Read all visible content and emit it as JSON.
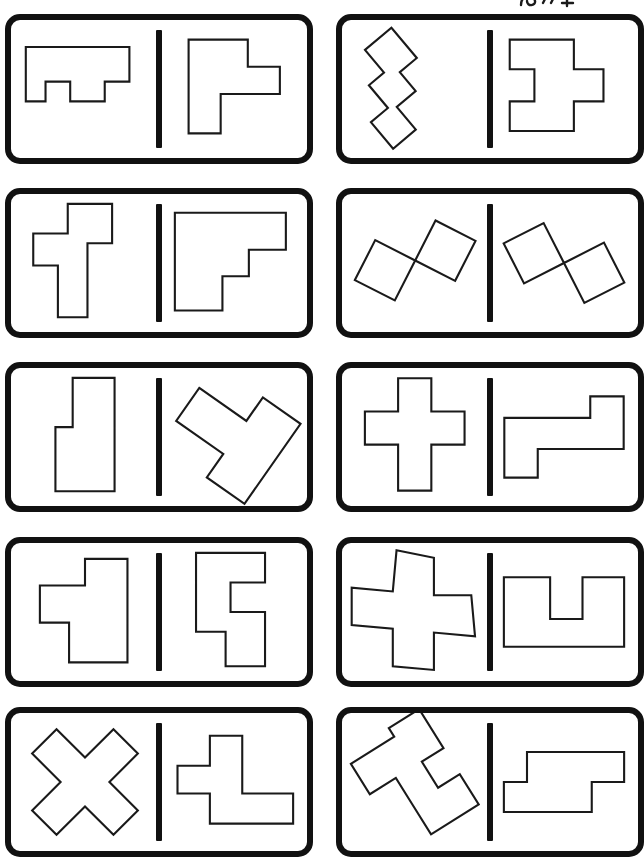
{
  "page": {
    "background_color": "#ffffff",
    "ink_color": "#111111",
    "shape_outline_color": "#1a1a1a",
    "card_count": 10,
    "columns": 2,
    "rows": 5,
    "corner_mark_label": "partial-logo-mark-cropped-at-top-edge"
  },
  "cards": [
    {
      "id": "card-1",
      "row": 1,
      "column": "left",
      "left_shape": {
        "name": "u-shaped-hexomino-notched-bar",
        "rotation_deg": 0,
        "cells": 9,
        "points": "6,8 48,8 48,22 38,22 38,30 24,30 24,22 14,22 14,30 6,30"
      },
      "right_shape": {
        "name": "t-shaped-heptomino-stepped",
        "rotation_deg": 0,
        "cells": 9,
        "points": "12,5 36,5 36,16 49,16 49,27 25,27 25,43 12,43"
      }
    },
    {
      "id": "card-2",
      "row": 1,
      "column": "right",
      "left_shape": {
        "name": "zigzag-zpentomino-rotated",
        "rotation_deg": -40,
        "cells": 8,
        "points": "22,6 36,6 36,22 27,22 27,32 17,32 17,44 5,44 5,30 14,30 14,18 22,18"
      },
      "right_shape": {
        "name": "plus-cross-shaped-nonomino",
        "rotation_deg": 0,
        "cells": 9,
        "points": "8,5 34,5 34,17 46,17 46,30 34,30 34,42 8,42 8,30 18,30 18,17 8,17"
      }
    },
    {
      "id": "card-3",
      "row": 2,
      "column": "left",
      "left_shape": {
        "name": "t-shaped-heptomino-with-left-arm",
        "rotation_deg": 0,
        "cells": 10,
        "points": "18,4 36,4 36,20 26,20 26,50 14,50 14,29 4,29 4,16 18,16"
      },
      "right_shape": {
        "name": "staircase-f-shaped-polyomino",
        "rotation_deg": 0,
        "cells": 10,
        "points": "6,6 48,6 48,20 34,20 34,30 24,30 24,43 6,43"
      }
    },
    {
      "id": "card-4",
      "row": 2,
      "column": "right",
      "left_shape": {
        "name": "w-zigzag-shape-rotated-diamond",
        "rotation_deg": -45,
        "cells": 8,
        "points": "4,18 16,6 28,18 40,6 52,18 40,30 28,18 16,30"
      },
      "right_shape": {
        "name": "w-zigzag-shape-rotated-mirrored",
        "rotation_deg": 20,
        "cells": 8,
        "points": "4,20 16,8 28,20 40,8 52,20 40,32 28,20 16,32"
      }
    },
    {
      "id": "card-5",
      "row": 3,
      "column": "left",
      "left_shape": {
        "name": "l-shaped-pentomino-vertical",
        "rotation_deg": 0,
        "cells": 8,
        "points": "21,4 38,4 38,50 14,50 14,24 21,24"
      },
      "right_shape": {
        "name": "t-shaped-pentomino-rotated",
        "rotation_deg": 35,
        "cells": 8,
        "points": "6,16 26,16 26,6 42,6 42,40 26,40 26,30 6,30"
      }
    },
    {
      "id": "card-6",
      "row": 3,
      "column": "right",
      "left_shape": {
        "name": "plus-cross-pentomino",
        "rotation_deg": 0,
        "cells": 9,
        "points": "20,4 33,4 33,17 46,17 46,30 33,30 33,48 20,48 20,30 7,30 7,17 20,17"
      },
      "right_shape": {
        "name": "z-shaped-stepped-polyomino",
        "rotation_deg": 0,
        "cells": 9,
        "points": "46,8 56,8 56,30 20,30 20,42 6,42 6,17 42,17 42,8"
      }
    },
    {
      "id": "card-7",
      "row": 4,
      "column": "left",
      "left_shape": {
        "name": "f-shaped-polyomino-left-arm",
        "rotation_deg": 0,
        "cells": 8,
        "points": "22,6 38,6 38,45 16,45 16,30 5,30 5,16 22,16"
      },
      "right_shape": {
        "name": "s-shaped-stepped-polyomino-vertical",
        "rotation_deg": 0,
        "cells": 9,
        "points": "6,4 34,4 34,16 20,16 20,28 34,28 34,50 18,50 18,36 6,36"
      }
    },
    {
      "id": "card-8",
      "row": 4,
      "column": "right",
      "left_shape": {
        "name": "pinwheel-shape-rotated-45",
        "rotation_deg": 45,
        "cells": 9,
        "points": "6,14 18,6 28,16 38,6 50,16 38,26 48,36 36,46 26,36 14,46 4,36 16,26"
      },
      "right_shape": {
        "name": "u-shaped-polyomino",
        "rotation_deg": 0,
        "cells": 9,
        "points": "6,12 26,12 26,30 40,30 40,12 58,12 58,42 6,42"
      }
    },
    {
      "id": "card-9",
      "row": 5,
      "column": "left",
      "left_shape": {
        "name": "x-cross-shape-rotated-45",
        "rotation_deg": 45,
        "cells": 9,
        "points": "18,4 30,4 30,18 44,18 44,30 30,30 30,44 18,44 18,30 4,30 4,18 18,18"
      },
      "right_shape": {
        "name": "l-shaped-polyomino-with-side-arm",
        "rotation_deg": 0,
        "cells": 9,
        "points": "22,5 36,5 36,30 58,30 58,43 22,43 22,30 8,30 8,18 22,18"
      }
    },
    {
      "id": "card-10",
      "row": 5,
      "column": "right",
      "left_shape": {
        "name": "y-branching-shape-rotated",
        "rotation_deg": -35,
        "cells": 9,
        "points": "24,4 38,4 38,22 28,22 28,34 38,34 38,48 16,48 16,34 16,22 4,22 4,8 24,8"
      },
      "right_shape": {
        "name": "stepped-z-polyomino-horizontal",
        "rotation_deg": 0,
        "cells": 9,
        "points": "16,14 58,14 58,27 44,27 44,40 6,40 6,27 16,27"
      }
    }
  ]
}
